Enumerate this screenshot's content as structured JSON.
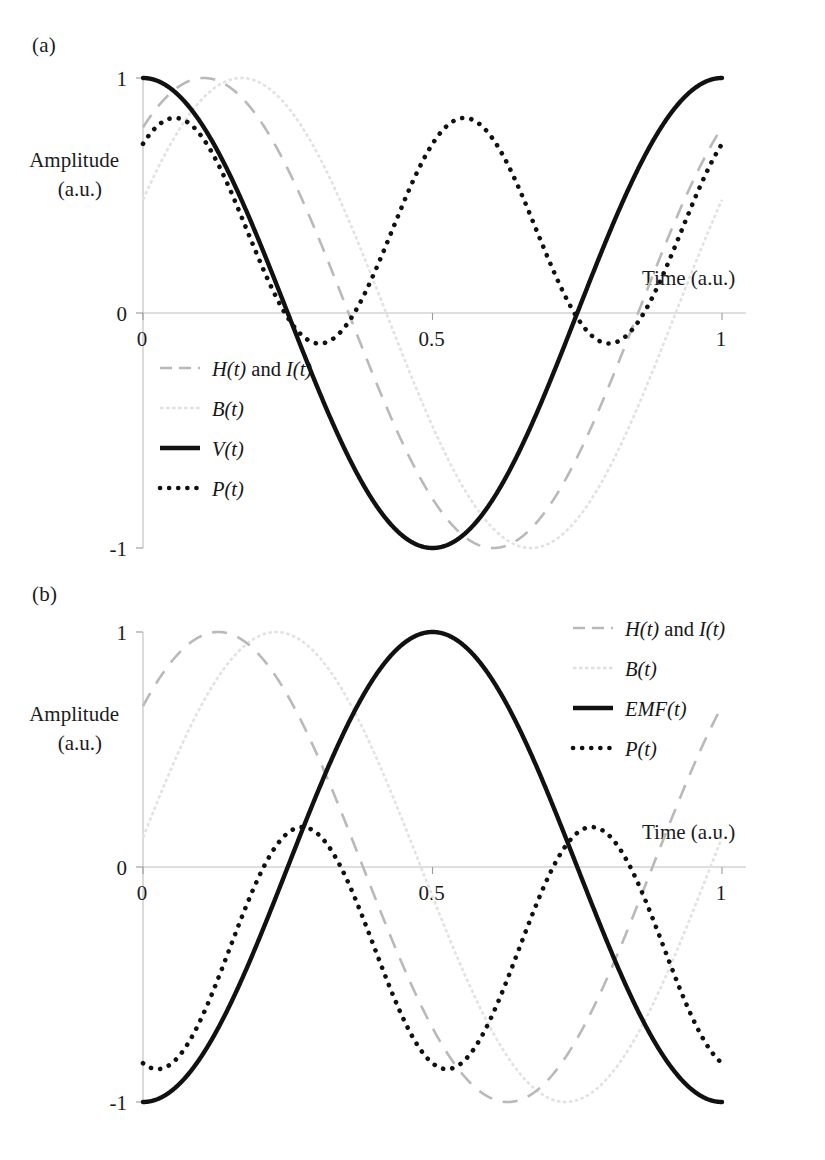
{
  "figure": {
    "panels": [
      {
        "id": "a",
        "label": "(a)",
        "y_axis_title_line1": "Amplitude",
        "y_axis_title_line2": "(a.u.)",
        "x_axis_title": "Time (a.u.)",
        "y_ticks": [
          "1",
          "0",
          "-1"
        ],
        "x_ticks": [
          "0",
          "0.5",
          "1"
        ],
        "legend": [
          {
            "key": "hi",
            "label": "H(t) and I(t)",
            "style": "dashed-gray"
          },
          {
            "key": "b",
            "label": "B(t)",
            "style": "dotted-light"
          },
          {
            "key": "v",
            "label": "V(t)",
            "style": "solid-black"
          },
          {
            "key": "p",
            "label": "P(t)",
            "style": "dotted-black"
          }
        ]
      },
      {
        "id": "b",
        "label": "(b)",
        "y_axis_title_line1": "Amplitude",
        "y_axis_title_line2": "(a.u.)",
        "x_axis_title": "Time (a.u.)",
        "y_ticks": [
          "1",
          "0",
          "-1"
        ],
        "x_ticks": [
          "0",
          "0.5",
          "1"
        ],
        "legend": [
          {
            "key": "hi",
            "label": "H(t) and I(t)",
            "style": "dashed-gray"
          },
          {
            "key": "b",
            "label": "B(t)",
            "style": "dotted-light"
          },
          {
            "key": "emf",
            "label": "EMF(t)",
            "style": "solid-black"
          },
          {
            "key": "p",
            "label": "P(t)",
            "style": "dotted-black"
          }
        ]
      }
    ]
  },
  "colors": {
    "solid_black": "#111111",
    "dashed_gray": "#b9b9b9",
    "dotted_light": "#e2e2e2",
    "axis_gray": "#bdbdbd",
    "text": "#1b1b1b",
    "background": "#ffffff"
  },
  "chart_data": [
    {
      "type": "line",
      "panel": "a",
      "title": "(a)",
      "xlabel": "Time (a.u.)",
      "ylabel": "Amplitude (a.u.)",
      "xlim": [
        0,
        1
      ],
      "ylim": [
        -1,
        1
      ],
      "xticks": [
        0,
        0.5,
        1
      ],
      "yticks": [
        -1,
        0,
        1
      ],
      "grid": false,
      "legend_position": "inside-lower-left",
      "series": [
        {
          "name": "H(t) and I(t)",
          "style": "dashed",
          "color": "#b9b9b9",
          "form": "sin(2*pi*t + 0.42*pi)",
          "amplitude": 1.0,
          "phase_fraction": 0.105,
          "peak_t": 0.105,
          "zero_up_t": 0.855,
          "min_t": 0.605
        },
        {
          "name": "B(t)",
          "style": "dotted-light",
          "color": "#e2e2e2",
          "form": "sin(2*pi*t + 0.16*pi)",
          "amplitude": 1.0,
          "phase_fraction": 0.17,
          "peak_t": 0.17,
          "zero_up_t": 0.92,
          "min_t": 0.67
        },
        {
          "name": "V(t)",
          "style": "solid",
          "color": "#111111",
          "form": "cos(2*pi*t)",
          "amplitude": 1.0,
          "phase_fraction": 0.0,
          "peak_t": 0.0,
          "min_t": 0.5,
          "value_at_0": 1.0,
          "value_at_1": 1.0
        },
        {
          "name": "P(t)",
          "style": "dotted",
          "color": "#111111",
          "form": "V(t)*I(t) product, 2f component",
          "amplitude_max": 0.83,
          "amplitude_min": -0.13,
          "offset": 0.35,
          "period": 0.5,
          "peaks_t": [
            0.055,
            0.555
          ],
          "mins_t": [
            0.305,
            0.805
          ],
          "value_at_0": 0.62,
          "value_at_1": 0.72
        }
      ]
    },
    {
      "type": "line",
      "panel": "b",
      "title": "(b)",
      "xlabel": "Time (a.u.)",
      "ylabel": "Amplitude (a.u.)",
      "xlim": [
        0,
        1
      ],
      "ylim": [
        -1,
        1
      ],
      "xticks": [
        0,
        0.5,
        1
      ],
      "yticks": [
        -1,
        0,
        1
      ],
      "grid": false,
      "legend_position": "inside-upper-right",
      "series": [
        {
          "name": "H(t) and I(t)",
          "style": "dashed",
          "color": "#b9b9b9",
          "form": "sin(2*pi*t + 0.26*pi)",
          "amplitude": 1.0,
          "phase_fraction": 0.13,
          "peak_t": 0.13,
          "min_t": 0.63,
          "value_at_0": 0.62
        },
        {
          "name": "B(t)",
          "style": "dotted-light",
          "color": "#e2e2e2",
          "form": "sin(2*pi*t + 0.06*pi)",
          "amplitude": 1.0,
          "phase_fraction": 0.23,
          "peak_t": 0.23,
          "min_t": 0.73,
          "value_at_0": 0.16
        },
        {
          "name": "EMF(t)",
          "style": "solid",
          "color": "#111111",
          "form": "-cos(2*pi*t)",
          "amplitude": 1.0,
          "peak_t": 0.5,
          "min_t": 0.0,
          "value_at_0": -1.0,
          "value_at_1": -1.0
        },
        {
          "name": "P(t)",
          "style": "dotted",
          "color": "#111111",
          "form": "EMF(t)*I(t) product, 2f component",
          "amplitude_max": 0.17,
          "amplitude_min": -0.86,
          "offset": -0.345,
          "period": 0.5,
          "peaks_t": [
            0.275,
            0.775
          ],
          "mins_t": [
            0.035,
            0.535
          ],
          "value_at_0": -0.74,
          "value_at_1": -0.8
        }
      ]
    }
  ]
}
